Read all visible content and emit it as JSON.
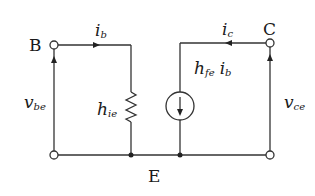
{
  "diagram": {
    "title": "",
    "type": "h-parameter small-signal equivalent circuit (common emitter, simplified)",
    "colors": {
      "stroke": "#333333",
      "text": "#1a1a1a",
      "background": "#ffffff"
    },
    "terminals": {
      "base": "B",
      "collector": "C",
      "emitter": "E"
    },
    "labels": {
      "ib": {
        "main": "i",
        "sub": "b"
      },
      "ic": {
        "main": "i",
        "sub": "c"
      },
      "vbe": {
        "main": "v",
        "sub": "be"
      },
      "vce": {
        "main": "v",
        "sub": "ce"
      },
      "hie": {
        "main": "h",
        "sub": "ie"
      },
      "hfe_ib": {
        "main": "h",
        "sub": "fe",
        "main2": "i",
        "sub2": "b"
      }
    },
    "components": [
      {
        "id": "hie",
        "kind": "resistor",
        "label": "h_ie"
      },
      {
        "id": "hfe_ib",
        "kind": "dependent-current-source",
        "label": "h_fe i_b",
        "direction": "down"
      }
    ]
  }
}
